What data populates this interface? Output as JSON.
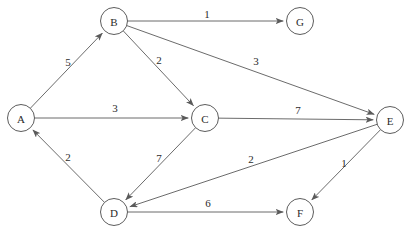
{
  "diagram": {
    "node_radius": 13.5,
    "colors": {
      "edge": "#5a5a5a",
      "node_stroke": "#4a4a4a",
      "node_fill": "#ffffff",
      "text": "#2b2b2b",
      "background": "#ffffff"
    },
    "nodes": [
      {
        "id": "A",
        "label": "A",
        "x": 21,
        "y": 118
      },
      {
        "id": "B",
        "label": "B",
        "x": 114,
        "y": 21
      },
      {
        "id": "C",
        "label": "C",
        "x": 205,
        "y": 118
      },
      {
        "id": "D",
        "label": "D",
        "x": 114,
        "y": 212
      },
      {
        "id": "E",
        "label": "E",
        "x": 390,
        "y": 120
      },
      {
        "id": "F",
        "label": "F",
        "x": 300,
        "y": 212
      },
      {
        "id": "G",
        "label": "G",
        "x": 300,
        "y": 21
      }
    ],
    "edges": [
      {
        "from": "A",
        "to": "B",
        "weight": "5",
        "label_x": 68,
        "label_y": 62
      },
      {
        "from": "B",
        "to": "G",
        "weight": "1",
        "label_x": 207,
        "label_y": 14
      },
      {
        "from": "B",
        "to": "C",
        "weight": "2",
        "label_x": 159,
        "label_y": 60
      },
      {
        "from": "B",
        "to": "E",
        "weight": "3",
        "label_x": 256,
        "label_y": 61
      },
      {
        "from": "A",
        "to": "C",
        "weight": "3",
        "label_x": 115,
        "label_y": 108
      },
      {
        "from": "C",
        "to": "E",
        "weight": "7",
        "label_x": 298,
        "label_y": 110
      },
      {
        "from": "C",
        "to": "D",
        "weight": "7",
        "label_x": 159,
        "label_y": 158
      },
      {
        "from": "D",
        "to": "A",
        "weight": "2",
        "label_x": 68,
        "label_y": 157
      },
      {
        "from": "E",
        "to": "D",
        "weight": "2",
        "label_x": 251,
        "label_y": 159
      },
      {
        "from": "E",
        "to": "F",
        "weight": "1",
        "label_x": 344,
        "label_y": 163
      },
      {
        "from": "D",
        "to": "F",
        "weight": "6",
        "label_x": 208,
        "label_y": 203
      }
    ]
  },
  "chart_data": {
    "type": "diagram",
    "nodes": [
      "A",
      "B",
      "C",
      "D",
      "E",
      "F",
      "G"
    ],
    "edges": [
      {
        "source": "A",
        "target": "B",
        "weight": 5
      },
      {
        "source": "B",
        "target": "G",
        "weight": 1
      },
      {
        "source": "B",
        "target": "C",
        "weight": 2
      },
      {
        "source": "B",
        "target": "E",
        "weight": 3
      },
      {
        "source": "A",
        "target": "C",
        "weight": 3
      },
      {
        "source": "C",
        "target": "E",
        "weight": 7
      },
      {
        "source": "C",
        "target": "D",
        "weight": 7
      },
      {
        "source": "D",
        "target": "A",
        "weight": 2
      },
      {
        "source": "E",
        "target": "D",
        "weight": 2
      },
      {
        "source": "E",
        "target": "F",
        "weight": 1
      },
      {
        "source": "D",
        "target": "F",
        "weight": 6
      }
    ]
  }
}
